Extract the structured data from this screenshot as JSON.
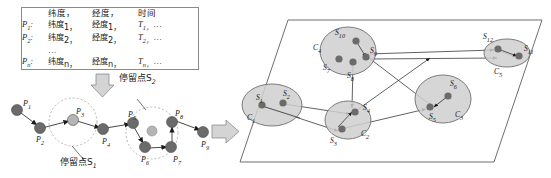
{
  "figure": {
    "background": "#ffffff",
    "ink": "#1a1a1a",
    "node_fill": "#6b6b6b",
    "node_fill_light": "#b5b5b5",
    "cluster_fill": "#cfcfcf",
    "cluster_stroke": "#6e6e6e",
    "arrow_fill": "#d4d4d4",
    "arrow_stroke": "#8a8a8a"
  },
  "table": {
    "header": {
      "point": "",
      "lat": "纬度，",
      "lon": "经度，",
      "time": "时间"
    },
    "rows": [
      {
        "point": "P",
        "point_sub": "1",
        "lat": "纬度",
        "lat_sub": "1，",
        "lon": "经度",
        "lon_sub": "1，",
        "time": "T",
        "time_sub": "1，",
        "time_tail": "…"
      },
      {
        "point": "P",
        "point_sub": "2",
        "lat": "纬度",
        "lat_sub": "2，",
        "lon": "经度",
        "lon_sub": "2，",
        "time": "T",
        "time_sub": "2，",
        "time_tail": "…"
      },
      {
        "point": "",
        "point_sub": "",
        "lat": "…",
        "lat_sub": "",
        "lon": "",
        "lon_sub": "",
        "time": "",
        "time_sub": "",
        "time_tail": ""
      },
      {
        "point": "P",
        "point_sub": "n",
        "lat": "纬度",
        "lat_sub": "n，",
        "lon": "经度",
        "lon_sub": "n，",
        "time": "T",
        "time_sub": "n，",
        "time_tail": "…"
      }
    ]
  },
  "trajectory": {
    "stay_label_1": "停留点S",
    "stay_label_1_sub": "1",
    "stay_label_2": "停留点S",
    "stay_label_2_sub": "2",
    "points": [
      {
        "id": "P1",
        "letter": "P",
        "sub": "1",
        "x": 17,
        "y": 110,
        "kind": "normal",
        "label_dx": 6,
        "label_dy": -10
      },
      {
        "id": "P2",
        "letter": "P",
        "sub": "2",
        "x": 40,
        "y": 128,
        "kind": "normal",
        "label_dx": -4,
        "label_dy": 8
      },
      {
        "id": "P3",
        "letter": "P",
        "sub": "3",
        "x": 73,
        "y": 120,
        "kind": "stay",
        "label_dx": 3,
        "label_dy": -12
      },
      {
        "id": "P4",
        "letter": "P",
        "sub": "4",
        "x": 103,
        "y": 129,
        "kind": "normal",
        "label_dx": -1,
        "label_dy": 9
      },
      {
        "id": "P5",
        "letter": "P",
        "sub": "5",
        "x": 133,
        "y": 123,
        "kind": "normal",
        "label_dx": -5,
        "label_dy": -12
      },
      {
        "id": "P6",
        "letter": "P",
        "sub": "6",
        "x": 145,
        "y": 147,
        "kind": "normal",
        "label_dx": -4,
        "label_dy": 9
      },
      {
        "id": "P7",
        "letter": "P",
        "sub": "7",
        "x": 171,
        "y": 146,
        "kind": "normal",
        "label_dx": 2,
        "label_dy": 9
      },
      {
        "id": "P8",
        "letter": "P",
        "sub": "8",
        "x": 172,
        "y": 122,
        "kind": "normal",
        "label_dx": 3,
        "label_dy": -12
      },
      {
        "id": "P9",
        "letter": "P",
        "sub": "9",
        "x": 203,
        "y": 132,
        "kind": "normal",
        "label_dx": -2,
        "label_dy": 9
      },
      {
        "id": "Pc",
        "letter": "",
        "sub": "",
        "x": 152,
        "y": 131,
        "kind": "center",
        "label_dx": 0,
        "label_dy": 0
      }
    ]
  },
  "cluster_panel": {
    "clusters": [
      {
        "id": "C1",
        "letter": "C",
        "sub": "1",
        "cx": 272,
        "cy": 105,
        "rx": 30,
        "ry": 21,
        "label_x": 247,
        "label_y": 120
      },
      {
        "id": "C2",
        "letter": "C",
        "sub": "2",
        "cx": 348,
        "cy": 120,
        "rx": 23,
        "ry": 19,
        "label_x": 361,
        "label_y": 136
      },
      {
        "id": "C3",
        "letter": "C",
        "sub": "3",
        "cx": 443,
        "cy": 99,
        "rx": 28,
        "ry": 24,
        "label_x": 458,
        "label_y": 117
      },
      {
        "id": "C4",
        "letter": "C",
        "sub": "4",
        "cx": 348,
        "cy": 51,
        "rx": 28,
        "ry": 24,
        "label_x": 313,
        "label_y": 50
      },
      {
        "id": "C5",
        "letter": "C",
        "sub": "5",
        "cx": 507,
        "cy": 53,
        "rx": 23,
        "ry": 14,
        "label_x": 496,
        "label_y": 73
      }
    ],
    "stay_points": [
      {
        "id": "S1",
        "letter": "S",
        "sub": "1",
        "x": 262,
        "y": 105,
        "label_dx": -5,
        "label_dy": -10
      },
      {
        "id": "S2",
        "letter": "S",
        "sub": "2",
        "x": 283,
        "y": 103,
        "label_dx": 2,
        "label_dy": -12
      },
      {
        "id": "S3",
        "letter": "S",
        "sub": "3",
        "x": 342,
        "y": 129,
        "label_dx": -10,
        "label_dy": 10
      },
      {
        "id": "S4",
        "letter": "S",
        "sub": "4",
        "x": 355,
        "y": 112,
        "label_dx": 9,
        "label_dy": -7
      },
      {
        "id": "S5",
        "letter": "S",
        "sub": "5",
        "x": 430,
        "y": 107,
        "label_dx": 0,
        "label_dy": 10
      },
      {
        "id": "S6",
        "letter": "S",
        "sub": "6",
        "x": 448,
        "y": 96,
        "label_dx": 6,
        "label_dy": -14
      },
      {
        "id": "S7",
        "letter": "S",
        "sub": "7",
        "x": 339,
        "y": 59,
        "label_dx": -12,
        "label_dy": 8
      },
      {
        "id": "S8",
        "letter": "S",
        "sub": "8",
        "x": 353,
        "y": 62,
        "label_dx": -3,
        "label_dy": 13
      },
      {
        "id": "S9",
        "letter": "S",
        "sub": "9",
        "x": 366,
        "y": 57,
        "label_dx": 5,
        "label_dy": -7
      },
      {
        "id": "S10",
        "letter": "S",
        "sub": "10",
        "x": 356,
        "y": 41,
        "label_dx": -18,
        "label_dy": -8
      },
      {
        "id": "S11",
        "letter": "S",
        "sub": "11",
        "x": 519,
        "y": 56,
        "label_dx": 8,
        "label_dy": -8
      },
      {
        "id": "S12",
        "letter": "S",
        "sub": "12",
        "x": 498,
        "y": 49,
        "label_dx": -10,
        "label_dy": -12
      }
    ]
  }
}
